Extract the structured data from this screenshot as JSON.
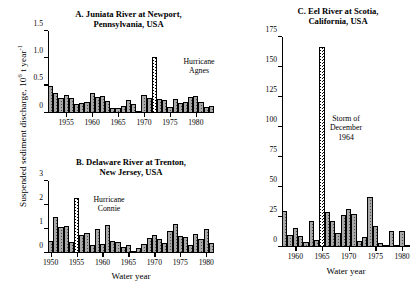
{
  "figure": {
    "y_axis_label_prefix": "Suspended sediment discharge, 10",
    "y_axis_label_exp1": "6",
    "y_axis_label_mid": " t year",
    "y_axis_label_exp2": "-1",
    "x_axis_label": "Water year"
  },
  "chart_data": [
    {
      "type": "bar",
      "panel": "A",
      "title_line1": "A. Juniata River at Newport,",
      "title_line2": "Pennsylvania, USA",
      "xlabel": "Water year",
      "ylabel": "Suspended sediment discharge, 10^6 t year^-1",
      "ylim": [
        0,
        1.5
      ],
      "yticks": [
        0,
        0.5,
        1.0,
        1.5
      ],
      "ytick_labels": [
        "0",
        "0.5",
        "1.0",
        "1.5"
      ],
      "xlim": [
        1951.5,
        1983.5
      ],
      "xticks": [
        1955,
        1960,
        1965,
        1970,
        1975,
        1980
      ],
      "xtick_labels": [
        "1955",
        "1960",
        "1965",
        "1970",
        "1975",
        "1980"
      ],
      "grid": false,
      "annotation": "Hurricane\nAgnes",
      "annotation_line1": "Hurricane",
      "annotation_line2": "Agnes",
      "highlight_year": 1972,
      "x": [
        1952,
        1953,
        1954,
        1955,
        1956,
        1957,
        1958,
        1959,
        1960,
        1961,
        1962,
        1963,
        1964,
        1965,
        1966,
        1967,
        1968,
        1969,
        1970,
        1971,
        1972,
        1973,
        1974,
        1975,
        1976,
        1977,
        1978,
        1979,
        1980,
        1981,
        1982,
        1983
      ],
      "values": [
        0.5,
        0.37,
        0.27,
        0.33,
        0.28,
        0.17,
        0.19,
        0.21,
        0.36,
        0.3,
        0.31,
        0.22,
        0.09,
        0.09,
        0.12,
        0.24,
        0.17,
        0.04,
        0.33,
        0.27,
        1.02,
        0.25,
        0.24,
        0.11,
        0.25,
        0.18,
        0.21,
        0.3,
        0.31,
        0.21,
        0.11,
        0.12
      ]
    },
    {
      "type": "bar",
      "panel": "B",
      "title_line1": "B. Delaware River at Trenton,",
      "title_line2": "New Jersey, USA",
      "xlabel": "Water year",
      "ylabel": "Suspended sediment discharge, 10^6 t year^-1",
      "ylim": [
        0,
        3
      ],
      "yticks": [
        0,
        1,
        2,
        3
      ],
      "ytick_labels": [
        "0",
        "1",
        "2",
        "3"
      ],
      "xlim": [
        1949.5,
        1981.5
      ],
      "xticks": [
        1950,
        1955,
        1960,
        1965,
        1970,
        1975,
        1980
      ],
      "xtick_labels": [
        "1950",
        "1955",
        "1960",
        "1965",
        "1970",
        "1975",
        "1980"
      ],
      "grid": false,
      "annotation_line1": "Hurricane",
      "annotation_line2": "Connie",
      "highlight_year": 1955,
      "x": [
        1950,
        1951,
        1952,
        1953,
        1954,
        1955,
        1956,
        1957,
        1958,
        1959,
        1960,
        1961,
        1962,
        1963,
        1964,
        1965,
        1966,
        1967,
        1968,
        1969,
        1970,
        1971,
        1972,
        1973,
        1974,
        1975,
        1976,
        1977,
        1978,
        1979,
        1980,
        1981
      ],
      "values": [
        0.48,
        1.5,
        1.1,
        1.12,
        0.44,
        2.3,
        0.76,
        0.83,
        0.35,
        1.0,
        0.37,
        1.17,
        0.5,
        0.44,
        0.27,
        0.35,
        0.08,
        0.22,
        0.38,
        0.62,
        0.75,
        0.58,
        0.43,
        0.9,
        1.22,
        0.72,
        0.68,
        0.35,
        0.8,
        0.57,
        1.0,
        0.42,
        0.27
      ]
    },
    {
      "type": "bar",
      "panel": "C",
      "title_line1": "C. Eel River at Scotia,",
      "title_line2": "California, USA",
      "xlabel": "Water year",
      "ylabel": "Suspended sediment discharge, 10^6 t year^-1",
      "ylim": [
        0,
        175
      ],
      "yticks": [
        0,
        25,
        50,
        75,
        100,
        125,
        150,
        175
      ],
      "ytick_labels": [
        "0",
        "25",
        "50",
        "75",
        "100",
        "125",
        "150",
        "175"
      ],
      "xlim": [
        1957.5,
        1981.5
      ],
      "xticks": [
        1960,
        1965,
        1970,
        1975,
        1980
      ],
      "xtick_labels": [
        "1960",
        "1965",
        "1970",
        "1975",
        "1980"
      ],
      "grid": false,
      "annotation_line1": "Storm of",
      "annotation_line2": "December",
      "annotation_line3": "1964",
      "highlight_year": 1965,
      "x": [
        1958,
        1959,
        1960,
        1961,
        1962,
        1963,
        1964,
        1965,
        1966,
        1967,
        1968,
        1969,
        1970,
        1971,
        1972,
        1973,
        1974,
        1975,
        1976,
        1977,
        1978,
        1979,
        1980,
        1981
      ],
      "values": [
        30.0,
        10.0,
        15.5,
        9.5,
        4.5,
        21.5,
        5.5,
        167.0,
        29.0,
        22.0,
        11.5,
        26.5,
        32.0,
        27.5,
        5.0,
        8.0,
        41.5,
        17.5,
        3.0,
        1.0,
        13.0,
        1.5,
        13.0,
        1.0
      ]
    }
  ]
}
